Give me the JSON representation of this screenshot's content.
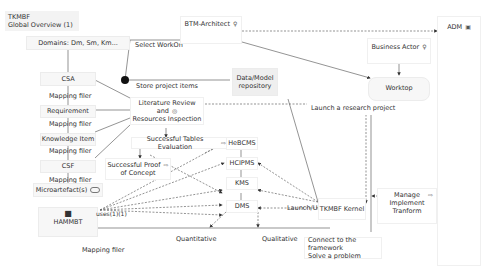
{
  "view": {
    "title_line1": "TKMBF",
    "title_line2": "Global Overview (1)"
  },
  "nodes": {
    "domains": "Domains: Dm, Sm, Km...",
    "btm_architect": "BTM-Architect",
    "adm": "ADM",
    "business_actor": "Business Actor",
    "worktop": "Worktop",
    "data_model_line1": "Data/Model",
    "data_model_line2": "repository",
    "csa": "CSA",
    "requirement": "Requirement",
    "knowledge_item": "Knowledge Item",
    "csf": "CSF",
    "microartefacts": "Microartefact(s)",
    "hammbt": "HAMMBT",
    "lit_review_line1": "Literature Review and",
    "lit_review_line2": "Resources Inspection",
    "tables_eval": "Successful Tables Evaluation",
    "proof_line1": "Successful Proof",
    "proof_line2": "of Concept",
    "hebcms": "HeBCMS",
    "hcipms": "HCIPMS",
    "kms": "KMS",
    "dms": "DMS",
    "launch_use": "Launch/Use",
    "tkmbf_kernel": "TKMBF Kernel",
    "manage_line1": "Manage",
    "manage_line2": "Implement",
    "manage_line3": "Tranform",
    "connect_line1": "Connect to the framework",
    "connect_line2": "Solve a problem"
  },
  "edges": {
    "select_workon": "Select WorkOn",
    "store_project_items": "Store project items",
    "launch_research": "Launch a research project",
    "mapping_filer": "Mapping filer",
    "uses": "uses(1)(1)",
    "quantitative": "Quantitative",
    "qualitative": "Qualitative"
  },
  "icons": {
    "actor": "♀",
    "process": "⇨",
    "goal": "◎",
    "service": "⬭",
    "component": "▣"
  },
  "colors": {
    "node_fill": "#f7f7f7",
    "line": "#555555",
    "dashed": "#666666",
    "junction": "#111111"
  }
}
